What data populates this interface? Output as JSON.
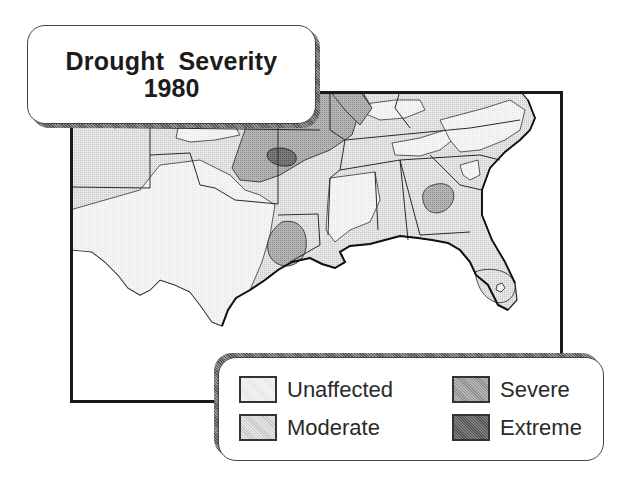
{
  "title": {
    "line1": "Drought  Severity",
    "line2": "1980"
  },
  "map": {
    "region": "Southeastern United States",
    "frame_border_color": "#1a1a1a"
  },
  "legend": {
    "items": [
      {
        "label": "Unaffected",
        "color": "#f3f3f3"
      },
      {
        "label": "Moderate",
        "color": "#dcdcdc"
      },
      {
        "label": "Severe",
        "color": "#a9a9a9"
      },
      {
        "label": "Extreme",
        "color": "#6f6f6f"
      }
    ]
  }
}
